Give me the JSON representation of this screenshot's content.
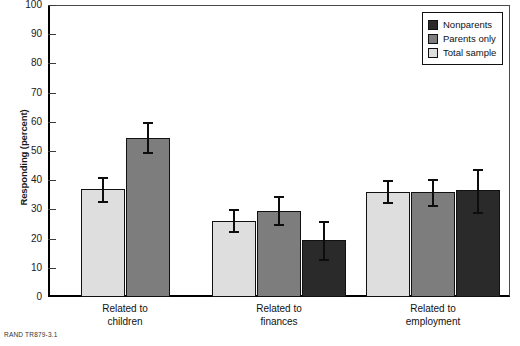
{
  "footer": {
    "text": "RAND TR879-3.1"
  },
  "legend": {
    "position": "top-right",
    "items": [
      {
        "label": "Nonparents",
        "color": "#2a2a2a",
        "key": "nonparents"
      },
      {
        "label": "Parents only",
        "color": "#7d7d7d",
        "key": "parents_only"
      },
      {
        "label": "Total sample",
        "color": "#dedede",
        "key": "total_sample"
      }
    ]
  },
  "chart_data": {
    "type": "bar",
    "title": "",
    "subtitle": "",
    "xlabel": "",
    "ylabel": "Responding (percent)",
    "ylim": [
      0,
      100
    ],
    "yticks": [
      0,
      10,
      20,
      30,
      40,
      50,
      60,
      70,
      80,
      90,
      100
    ],
    "ytick_labels": [
      "0",
      "10",
      "20",
      "30",
      "40",
      "50",
      "60",
      "70",
      "80",
      "90",
      "100"
    ],
    "grid": false,
    "error_bars": true,
    "categories": [
      "Related to children",
      "Related to finances",
      "Related to employment"
    ],
    "category_lines": [
      [
        "Related to",
        "children"
      ],
      [
        "Related to",
        "finances"
      ],
      [
        "Related to",
        "employment"
      ]
    ],
    "series": [
      {
        "name": "Total sample",
        "color": "#dedede",
        "values": [
          37,
          26,
          36
        ],
        "err_low": [
          33,
          22.5,
          32.5
        ],
        "err_high": [
          41,
          30,
          40
        ]
      },
      {
        "name": "Parents only",
        "color": "#7d7d7d",
        "values": [
          54.5,
          29.5,
          36
        ],
        "err_low": [
          49.5,
          25,
          31.5
        ],
        "err_high": [
          60,
          34.5,
          40.5
        ]
      },
      {
        "name": "Nonparents",
        "color": "#2a2a2a",
        "values": [
          null,
          19.5,
          36.5
        ],
        "err_low": [
          null,
          13,
          29
        ],
        "err_high": [
          null,
          26,
          44
        ]
      }
    ]
  }
}
